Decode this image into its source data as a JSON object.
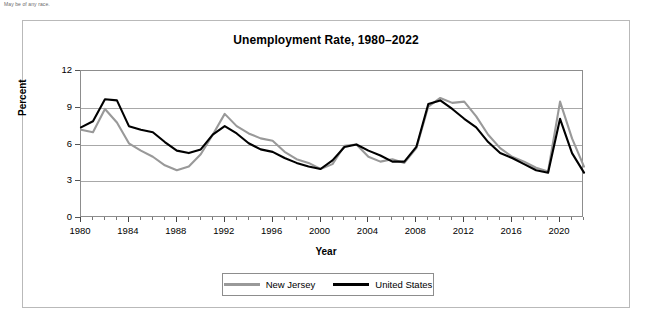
{
  "footnote": "May be of any race.",
  "chart_data": {
    "type": "line",
    "title": "Unemployment Rate, 1980–2022",
    "xlabel": "Year",
    "ylabel": "Percent",
    "xlim": [
      1980,
      2022
    ],
    "ylim": [
      0,
      12
    ],
    "yticks": [
      0,
      3,
      6,
      9,
      12
    ],
    "xticks": [
      1980,
      1984,
      1988,
      1992,
      1996,
      2000,
      2004,
      2008,
      2012,
      2016,
      2020
    ],
    "x_minor_tick_interval": 1,
    "grid": "horizontal",
    "legend_position": "bottom-center",
    "x": [
      1980,
      1981,
      1982,
      1983,
      1984,
      1985,
      1986,
      1987,
      1988,
      1989,
      1990,
      1991,
      1992,
      1993,
      1994,
      1995,
      1996,
      1997,
      1998,
      1999,
      2000,
      2001,
      2002,
      2003,
      2004,
      2005,
      2006,
      2007,
      2008,
      2009,
      2010,
      2011,
      2012,
      2013,
      2014,
      2015,
      2016,
      2017,
      2018,
      2019,
      2020,
      2021,
      2022
    ],
    "series": [
      {
        "name": "New Jersey",
        "color": "#999999",
        "values": [
          7.2,
          7.0,
          8.9,
          7.8,
          6.1,
          5.5,
          5.0,
          4.3,
          3.9,
          4.2,
          5.2,
          6.8,
          8.5,
          7.5,
          6.9,
          6.5,
          6.3,
          5.4,
          4.8,
          4.5,
          4.0,
          4.4,
          5.9,
          6.0,
          5.0,
          4.6,
          4.8,
          4.5,
          5.7,
          9.1,
          9.8,
          9.4,
          9.5,
          8.3,
          6.8,
          5.7,
          5.0,
          4.6,
          4.1,
          3.8,
          9.5,
          6.5,
          4.2
        ]
      },
      {
        "name": "United States",
        "color": "#000000",
        "values": [
          7.4,
          7.9,
          9.7,
          9.6,
          7.5,
          7.2,
          7.0,
          6.2,
          5.5,
          5.3,
          5.6,
          6.8,
          7.5,
          6.9,
          6.1,
          5.6,
          5.4,
          4.9,
          4.5,
          4.2,
          4.0,
          4.7,
          5.8,
          6.0,
          5.5,
          5.1,
          4.6,
          4.6,
          5.8,
          9.3,
          9.6,
          8.9,
          8.1,
          7.4,
          6.2,
          5.3,
          4.9,
          4.4,
          3.9,
          3.7,
          8.1,
          5.3,
          3.7
        ]
      }
    ]
  },
  "legend": {
    "items": [
      {
        "label": "New Jersey",
        "color": "#999999"
      },
      {
        "label": "United States",
        "color": "#000000"
      }
    ]
  }
}
